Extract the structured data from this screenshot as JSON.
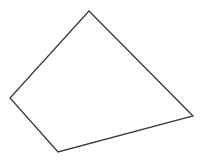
{
  "diagram": {
    "type": "polygon",
    "shape": "quadrilateral",
    "canvas": {
      "width": 202,
      "height": 160,
      "background": "#ffffff"
    },
    "stroke": "#3a3a3a",
    "stroke_width": 1.3,
    "fill": "none",
    "vertices": [
      {
        "name": "top",
        "x": 89,
        "y": 11
      },
      {
        "name": "right",
        "x": 193,
        "y": 116
      },
      {
        "name": "bottom",
        "x": 58,
        "y": 152
      },
      {
        "name": "left",
        "x": 10,
        "y": 98
      }
    ]
  }
}
